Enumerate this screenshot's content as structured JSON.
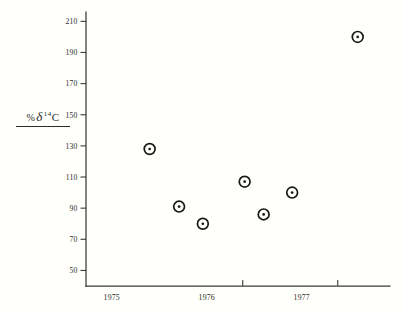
{
  "figure": {
    "background_color": "#fffffc",
    "ink_color": "#17171a",
    "axis_color": "#3a3a36"
  },
  "axis_label": {
    "permil_symbol": "%",
    "delta_symbol": "δ",
    "mass_number": "14",
    "element": "C",
    "full_text": "% δ 14C"
  },
  "y_axis": {
    "ticks": [
      "210",
      "190",
      "170",
      "150",
      "130",
      "110",
      "90",
      "70",
      "50"
    ],
    "min": 50,
    "max": 210,
    "step": 20
  },
  "x_axis": {
    "labels": [
      "1975",
      "1976",
      "1977"
    ],
    "tick_values": [
      "1975.0",
      "1976.0",
      "1977.0"
    ]
  },
  "chart_data": {
    "type": "scatter",
    "title": "",
    "subtitle": "",
    "xlabel": "",
    "ylabel": "% δ 14C",
    "grid": false,
    "legend": null,
    "xlim": [
      1974.35,
      1977.55
    ],
    "ylim": [
      40,
      216
    ],
    "ytick_labels": [
      "210",
      "190",
      "170",
      "150",
      "130",
      "110",
      "90",
      "70",
      "50"
    ],
    "ytick_values": [
      210,
      190,
      170,
      150,
      130,
      110,
      90,
      70,
      50
    ],
    "xtick_labels": [
      "1975",
      "1976",
      "1977"
    ],
    "xtick_values": [
      1975.0,
      1976.0,
      1977.0
    ],
    "marker": "circle-with-center-dot",
    "series": [
      {
        "name": "delta 14C measurements",
        "points": [
          {
            "x": 1975.02,
            "y": 128
          },
          {
            "x": 1975.33,
            "y": 91
          },
          {
            "x": 1975.58,
            "y": 80
          },
          {
            "x": 1976.02,
            "y": 107
          },
          {
            "x": 1976.22,
            "y": 86
          },
          {
            "x": 1976.52,
            "y": 100
          },
          {
            "x": 1977.21,
            "y": 200
          }
        ]
      }
    ]
  }
}
